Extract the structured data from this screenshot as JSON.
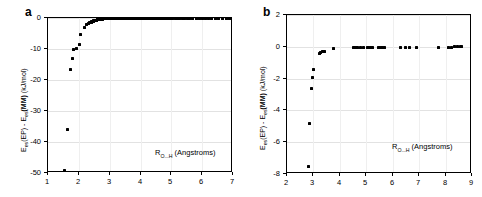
{
  "figure": {
    "background": "#ffffff",
    "marker_color": "#000000",
    "grid_color": "#e2e2e2",
    "axis_color": "#000000"
  },
  "panels": [
    {
      "letter": "a",
      "ytitle_prefix": "E",
      "ytitle_sub1": "es",
      "ytitle_mid": "(EP) - E",
      "ytitle_sub2": "es",
      "ytitle_bold": "(MM)",
      "ytitle_units": " (kJ/mol)",
      "xtitle_prefix": "R",
      "xtitle_sub": "O...H",
      "xtitle_units": " (Angstroms)",
      "xticks": [
        "1",
        "2",
        "3",
        "4",
        "5",
        "6",
        "7"
      ],
      "yticks": [
        "0",
        "-10",
        "-20",
        "-30",
        "-40",
        "-50"
      ]
    },
    {
      "letter": "b",
      "ytitle_prefix": "E",
      "ytitle_sub1": "es",
      "ytitle_mid": "(EP) - E",
      "ytitle_sub2": "es",
      "ytitle_bold": "(MM)",
      "ytitle_units": " (kJ/mol)",
      "xtitle_prefix": "R",
      "xtitle_sub": "O...H",
      "xtitle_units": " (Angstroms)",
      "xticks": [
        "2",
        "3",
        "4",
        "5",
        "6",
        "7",
        "8",
        "9"
      ],
      "yticks": [
        "2",
        "0",
        "-2",
        "-4",
        "-6",
        "-8"
      ]
    }
  ],
  "chart_data": [
    {
      "type": "scatter",
      "panel": "a",
      "title": "",
      "xlabel": "R_O...H (Angstroms)",
      "ylabel": "E_es(EP) - E_es(MM) (kJ/mol)",
      "xlim": [
        1,
        7
      ],
      "ylim": [
        -50,
        0
      ],
      "xticks": [
        1,
        2,
        3,
        4,
        5,
        6,
        7
      ],
      "yticks": [
        0,
        -10,
        -20,
        -30,
        -40,
        -50
      ],
      "grid": "horizontal",
      "legend": "none",
      "x": [
        1.52,
        1.62,
        1.74,
        1.8,
        1.84,
        1.92,
        2.02,
        2.06,
        2.18,
        2.24,
        2.3,
        2.34,
        2.37,
        2.4,
        2.42,
        2.44,
        2.46,
        2.48,
        2.5,
        2.52,
        2.54,
        2.56,
        2.58,
        2.6,
        2.62,
        2.64,
        2.66,
        2.7,
        2.74,
        2.78,
        2.82,
        2.88,
        2.94,
        3.0,
        3.06,
        3.12,
        3.18,
        3.24,
        3.3,
        3.36,
        3.42,
        3.48,
        3.54,
        3.6,
        3.66,
        3.72,
        3.78,
        3.84,
        3.9,
        3.96,
        4.02,
        4.08,
        4.14,
        4.2,
        4.26,
        4.32,
        4.38,
        4.44,
        4.5,
        4.56,
        4.62,
        4.68,
        4.74,
        4.8,
        4.86,
        4.92,
        4.98,
        5.04,
        5.12,
        5.2,
        5.28,
        5.36,
        5.44,
        5.52,
        5.6,
        5.7,
        5.8,
        5.9,
        6.0,
        6.1,
        6.2,
        6.3,
        6.42,
        6.54,
        6.66,
        6.78,
        6.9,
        6.98
      ],
      "y": [
        -49.2,
        -36.0,
        -16.7,
        -13.2,
        -10.3,
        -9.8,
        -8.6,
        -5.4,
        -3.0,
        -2.2,
        -1.9,
        -1.6,
        -1.4,
        -1.3,
        -1.2,
        -1.1,
        -1.0,
        -0.9,
        -0.85,
        -0.8,
        -0.75,
        -0.7,
        -0.65,
        -0.6,
        -0.55,
        -0.5,
        -0.45,
        -0.42,
        -0.38,
        -0.35,
        -0.32,
        -0.3,
        -0.28,
        -0.26,
        -0.24,
        -0.22,
        -0.2,
        -0.19,
        -0.18,
        -0.17,
        -0.16,
        -0.15,
        -0.14,
        -0.13,
        -0.12,
        -0.12,
        -0.11,
        -0.11,
        -0.1,
        -0.1,
        -0.09,
        -0.09,
        -0.08,
        -0.08,
        -0.08,
        -0.07,
        -0.07,
        -0.07,
        -0.06,
        -0.06,
        -0.06,
        -0.06,
        -0.05,
        -0.05,
        -0.05,
        -0.05,
        -0.05,
        -0.04,
        -0.04,
        -0.04,
        -0.04,
        -0.04,
        -0.03,
        -0.03,
        -0.03,
        -0.03,
        -0.03,
        -0.03,
        -0.02,
        -0.02,
        -0.02,
        -0.02,
        -0.02,
        -0.02,
        -0.02,
        -0.01,
        -0.01,
        -0.01
      ]
    },
    {
      "type": "scatter",
      "panel": "b",
      "title": "",
      "xlabel": "R_O...H (Angstroms)",
      "ylabel": "E_es(EP) - E_es(MM) (kJ/mol)",
      "xlim": [
        2,
        9
      ],
      "ylim": [
        -8,
        2
      ],
      "xticks": [
        2,
        3,
        4,
        5,
        6,
        7,
        8,
        9
      ],
      "yticks": [
        2,
        0,
        -2,
        -4,
        -6,
        -8
      ],
      "grid": "horizontal",
      "legend": "none",
      "x": [
        2.8,
        2.86,
        2.93,
        2.97,
        3.0,
        3.22,
        3.28,
        3.35,
        3.42,
        3.75,
        4.5,
        4.56,
        4.62,
        4.68,
        4.78,
        4.9,
        5.05,
        5.1,
        5.16,
        5.22,
        5.45,
        5.5,
        5.56,
        5.62,
        5.7,
        6.3,
        6.48,
        6.62,
        6.9,
        7.75,
        8.1,
        8.22,
        8.34,
        8.46,
        8.55,
        8.6
      ],
      "y": [
        -7.55,
        -4.85,
        -2.6,
        -1.93,
        -1.45,
        -0.42,
        -0.38,
        -0.3,
        -0.27,
        -0.08,
        -0.05,
        -0.05,
        -0.04,
        -0.04,
        -0.04,
        -0.03,
        -0.04,
        -0.04,
        -0.03,
        -0.03,
        -0.03,
        -0.03,
        -0.03,
        -0.02,
        -0.02,
        -0.03,
        -0.02,
        -0.02,
        -0.02,
        -0.02,
        -0.02,
        -0.02,
        -0.01,
        -0.01,
        -0.01,
        -0.01
      ]
    }
  ]
}
